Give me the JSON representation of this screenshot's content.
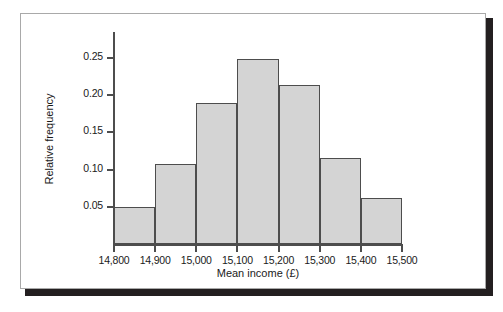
{
  "chart_data": {
    "type": "bar",
    "title": "",
    "subtitle": "",
    "xlabel": "Mean income (£)",
    "ylabel": "Relative frequency",
    "xlim": [
      14800,
      15500
    ],
    "ylim": [
      0,
      0.2625
    ],
    "grid": false,
    "legend": null,
    "bin_width": 100,
    "bin_edges": [
      14800,
      14900,
      15000,
      15100,
      15200,
      15300,
      15400,
      15500
    ],
    "categories": [
      "14,800-14,900",
      "14,900-15,000",
      "15,000-15,100",
      "15,100-15,200",
      "15,200-15,300",
      "15,300-15,400",
      "15,400-15,500"
    ],
    "values": [
      0.05,
      0.108,
      0.19,
      0.249,
      0.214,
      0.116,
      0.062
    ],
    "x_ticks": [
      14800,
      14900,
      15000,
      15100,
      15200,
      15300,
      15400,
      15500
    ],
    "x_tick_labels": [
      "14,800",
      "14,900",
      "15,000",
      "15,100",
      "15,200",
      "15,300",
      "15,400",
      "15,500"
    ],
    "y_ticks": [
      0.05,
      0.1,
      0.15,
      0.2,
      0.25
    ],
    "y_tick_labels": [
      "0.05",
      "0.10",
      "0.15",
      "0.20",
      "0.25"
    ],
    "colors": {
      "bar_fill": "#d4d4d4",
      "bar_border": "#4d4d4d",
      "axis": "#4d4d4d",
      "text": "#1a1a1a",
      "background": "#ffffff",
      "frame_border": "#a9a9a9",
      "frame_shadow": "#231f20"
    }
  }
}
